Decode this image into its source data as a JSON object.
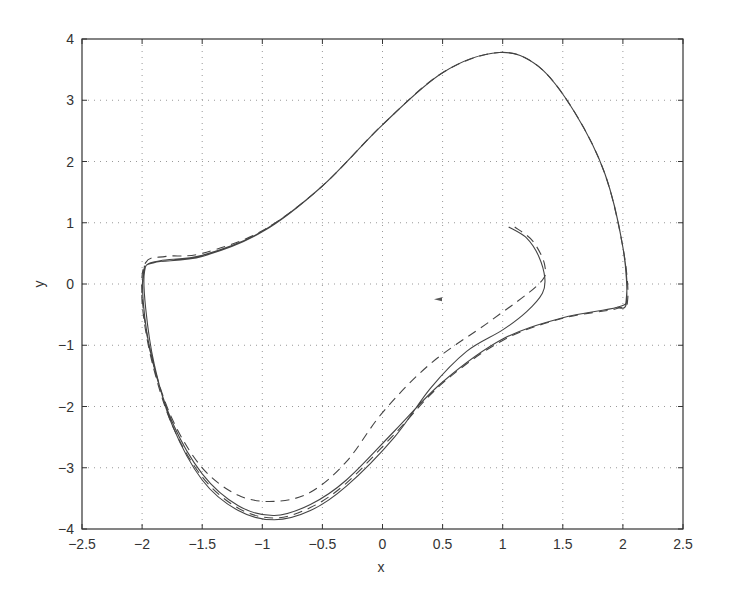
{
  "chart_data": {
    "type": "line",
    "title": "",
    "xlabel": "x",
    "ylabel": "y",
    "xlim": [
      -2.5,
      2.5
    ],
    "ylim": [
      -4,
      4
    ],
    "xticks": [
      "-2.5",
      "-2",
      "-1.5",
      "-1",
      "-0.5",
      "0",
      "0.5",
      "1",
      "1.5",
      "2",
      "2.5"
    ],
    "yticks": [
      "4",
      "3",
      "2",
      "1",
      "0",
      "-1",
      "-2",
      "-3",
      "-4"
    ],
    "grid": true,
    "legend": null,
    "series": [
      {
        "name": "trajectory (solid)",
        "style": "solid",
        "points": [
          [
            1.05,
            0.93
          ],
          [
            1.2,
            0.75
          ],
          [
            1.3,
            0.45
          ],
          [
            1.35,
            0.1
          ],
          [
            1.33,
            -0.15
          ],
          [
            1.2,
            -0.45
          ],
          [
            1.0,
            -0.75
          ],
          [
            0.7,
            -1.1
          ],
          [
            0.4,
            -1.7
          ],
          [
            0.1,
            -2.5
          ],
          [
            -0.3,
            -3.3
          ],
          [
            -0.6,
            -3.7
          ],
          [
            -0.9,
            -3.85
          ],
          [
            -1.2,
            -3.7
          ],
          [
            -1.5,
            -3.2
          ],
          [
            -1.75,
            -2.3
          ],
          [
            -1.9,
            -1.3
          ],
          [
            -1.97,
            -0.4
          ],
          [
            -1.98,
            0.2
          ],
          [
            -1.9,
            0.35
          ],
          [
            -1.5,
            0.45
          ],
          [
            -1.0,
            0.85
          ],
          [
            -0.5,
            1.6
          ],
          [
            0,
            2.6
          ],
          [
            0.5,
            3.45
          ],
          [
            0.97,
            3.78
          ],
          [
            1.3,
            3.55
          ],
          [
            1.6,
            2.8
          ],
          [
            1.85,
            1.8
          ],
          [
            2.0,
            0.6
          ],
          [
            2.03,
            -0.2
          ],
          [
            1.95,
            -0.38
          ],
          [
            1.5,
            -0.55
          ],
          [
            1.0,
            -0.9
          ],
          [
            0.5,
            -1.6
          ],
          [
            0.1,
            -2.4
          ],
          [
            -0.3,
            -3.2
          ],
          [
            -0.6,
            -3.6
          ],
          [
            -0.9,
            -3.78
          ],
          [
            -1.2,
            -3.62
          ],
          [
            -1.5,
            -3.1
          ],
          [
            -1.75,
            -2.25
          ],
          [
            -1.92,
            -1.2
          ],
          [
            -1.99,
            -0.3
          ],
          [
            -1.98,
            0.25
          ],
          [
            -1.85,
            0.38
          ],
          [
            -1.5,
            0.47
          ],
          [
            -1.0,
            0.86
          ],
          [
            -0.5,
            1.6
          ],
          [
            0,
            2.6
          ],
          [
            0.5,
            3.45
          ],
          [
            0.97,
            3.78
          ],
          [
            1.3,
            3.55
          ],
          [
            1.6,
            2.8
          ],
          [
            1.85,
            1.8
          ],
          [
            2.0,
            0.6
          ],
          [
            2.03,
            -0.3
          ],
          [
            1.95,
            -0.38
          ]
        ]
      },
      {
        "name": "trajectory (dashed)",
        "style": "dashed",
        "points": [
          [
            1.1,
            0.93
          ],
          [
            1.25,
            0.7
          ],
          [
            1.35,
            0.3
          ],
          [
            1.3,
            0.0
          ],
          [
            0.9,
            -0.6
          ],
          [
            0.4,
            -1.3
          ],
          [
            0.0,
            -2.1
          ],
          [
            -0.3,
            -2.9
          ],
          [
            -0.6,
            -3.4
          ],
          [
            -0.9,
            -3.55
          ],
          [
            -1.2,
            -3.45
          ],
          [
            -1.5,
            -3.0
          ],
          [
            -1.75,
            -2.2
          ],
          [
            -1.92,
            -1.2
          ],
          [
            -2.0,
            -0.2
          ],
          [
            -1.97,
            0.35
          ],
          [
            -1.8,
            0.45
          ],
          [
            -1.5,
            0.5
          ],
          [
            -1.0,
            0.87
          ],
          [
            -0.5,
            1.6
          ],
          [
            0,
            2.6
          ],
          [
            0.5,
            3.45
          ],
          [
            0.97,
            3.78
          ],
          [
            1.3,
            3.55
          ],
          [
            1.6,
            2.8
          ],
          [
            1.85,
            1.8
          ],
          [
            2.0,
            0.6
          ],
          [
            2.04,
            -0.25
          ],
          [
            1.95,
            -0.4
          ],
          [
            1.5,
            -0.56
          ],
          [
            1.0,
            -0.92
          ],
          [
            0.5,
            -1.62
          ],
          [
            0.1,
            -2.45
          ],
          [
            -0.3,
            -3.25
          ],
          [
            -0.6,
            -3.65
          ],
          [
            -0.9,
            -3.82
          ],
          [
            -1.2,
            -3.66
          ],
          [
            -1.5,
            -3.15
          ],
          [
            -1.75,
            -2.3
          ],
          [
            -1.92,
            -1.25
          ],
          [
            -2.0,
            -0.3
          ],
          [
            -1.98,
            0.3
          ]
        ]
      }
    ],
    "annotations": [
      {
        "type": "arrow-marker",
        "x": 0.47,
        "y": -0.25
      }
    ]
  }
}
